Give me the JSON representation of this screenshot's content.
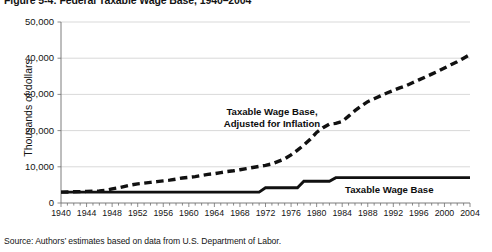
{
  "figure": {
    "title": "Figure 5-4: Federal Taxable Wage Base, 1940–2004",
    "source_note": "Source: Authors’ estimates based on data from U.S. Department of Labor."
  },
  "annotations": {
    "inflation_label": "Taxable Wage Base,\nAdjusted for Inflation",
    "nominal_label": "Taxable Wage Base"
  },
  "chart_data": {
    "type": "line",
    "title": "Figure 5-4: Federal Taxable Wage Base, 1940–2004",
    "xlabel": "",
    "ylabel": "Thousands of dollars",
    "xlim": [
      1940,
      2004
    ],
    "ylim": [
      0,
      50000
    ],
    "yticks": [
      0,
      10000,
      20000,
      30000,
      40000,
      50000
    ],
    "ytick_labels": [
      "0",
      "10,000",
      "20,000",
      "30,000",
      "40,000",
      "50,000"
    ],
    "xticks": [
      1940,
      1944,
      1948,
      1952,
      1956,
      1960,
      1964,
      1968,
      1972,
      1976,
      1980,
      1984,
      1988,
      1992,
      1996,
      2000,
      2004
    ],
    "xtick_labels": [
      "1940",
      "1944",
      "1948",
      "1952",
      "1956",
      "1960",
      "1964",
      "1968",
      "1972",
      "1976",
      "1980",
      "1984",
      "1988",
      "1992",
      "1996",
      "2000",
      "2004"
    ],
    "grid": "horizontal",
    "legend": "in-plot annotations",
    "x": [
      1940,
      1941,
      1942,
      1943,
      1944,
      1945,
      1946,
      1947,
      1948,
      1949,
      1950,
      1951,
      1952,
      1953,
      1954,
      1955,
      1956,
      1957,
      1958,
      1959,
      1960,
      1961,
      1962,
      1963,
      1964,
      1965,
      1966,
      1967,
      1968,
      1969,
      1970,
      1971,
      1972,
      1973,
      1974,
      1975,
      1976,
      1977,
      1978,
      1979,
      1980,
      1981,
      1982,
      1983,
      1984,
      1985,
      1986,
      1987,
      1988,
      1989,
      1990,
      1991,
      1992,
      1993,
      1994,
      1995,
      1996,
      1997,
      1998,
      1999,
      2000,
      2001,
      2002,
      2003,
      2004
    ],
    "series": [
      {
        "name": "Taxable Wage Base, Adjusted for Inflation",
        "style": "dashed",
        "color": "#111111",
        "values": [
          3000,
          3050,
          3100,
          3150,
          3200,
          3250,
          3300,
          3500,
          3900,
          4200,
          4600,
          5000,
          5300,
          5500,
          5700,
          5900,
          6100,
          6300,
          6600,
          6900,
          7100,
          7300,
          7600,
          7900,
          8100,
          8400,
          8700,
          8900,
          9200,
          9500,
          9800,
          10100,
          10400,
          10800,
          11500,
          12200,
          13300,
          14600,
          16000,
          17600,
          19500,
          20800,
          21800,
          22000,
          22500,
          24000,
          25500,
          26800,
          28000,
          28800,
          29600,
          30400,
          31100,
          31800,
          32400,
          33200,
          34000,
          34800,
          35600,
          36400,
          37300,
          38200,
          39000,
          40000,
          41000
        ]
      },
      {
        "name": "Taxable Wage Base",
        "style": "solid",
        "color": "#111111",
        "values": [
          3000,
          3000,
          3000,
          3000,
          3000,
          3000,
          3000,
          3000,
          3000,
          3000,
          3000,
          3000,
          3000,
          3000,
          3000,
          3000,
          3000,
          3000,
          3000,
          3000,
          3000,
          3000,
          3000,
          3000,
          3000,
          3000,
          3000,
          3000,
          3000,
          3000,
          3000,
          3000,
          4200,
          4200,
          4200,
          4200,
          4200,
          4200,
          6000,
          6000,
          6000,
          6000,
          6000,
          7000,
          7000,
          7000,
          7000,
          7000,
          7000,
          7000,
          7000,
          7000,
          7000,
          7000,
          7000,
          7000,
          7000,
          7000,
          7000,
          7000,
          7000,
          7000,
          7000,
          7000,
          7000
        ]
      }
    ]
  }
}
